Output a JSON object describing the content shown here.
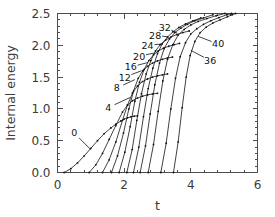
{
  "chart_data": {
    "type": "line",
    "title": "",
    "xlabel": "t",
    "ylabel": "Internal energy",
    "xlim": [
      0,
      6
    ],
    "ylim": [
      0.0,
      2.5
    ],
    "grid": false,
    "legend_position": "inline-labels",
    "x_ticks": [
      0,
      2,
      4,
      6
    ],
    "x_tick_labels": [
      "0",
      "2",
      "4",
      "6"
    ],
    "x_minor_per_major": 4,
    "y_ticks": [
      0.0,
      0.5,
      1.0,
      1.5,
      2.0,
      2.5
    ],
    "y_tick_labels": [
      "0.0",
      "0.5",
      "1.0",
      "1.5",
      "2.0",
      "2.5"
    ],
    "y_minor_per_major": 4,
    "marker": "dot",
    "series": [
      {
        "name": "0",
        "label": "0",
        "label_pos": [
          0.5,
          0.62
        ],
        "leader_to": [
          1.0,
          0.36
        ],
        "x": [
          0.2,
          0.4,
          0.6,
          0.8,
          1.0,
          1.2,
          1.4,
          1.6,
          1.75,
          1.9,
          2.0,
          2.1,
          2.2,
          2.3,
          2.4
        ],
        "y": [
          0.0,
          0.06,
          0.15,
          0.26,
          0.38,
          0.5,
          0.61,
          0.7,
          0.76,
          0.81,
          0.84,
          0.86,
          0.875,
          0.885,
          0.89
        ]
      },
      {
        "name": "4",
        "label": "4",
        "label_pos": [
          1.52,
          1.02
        ],
        "leader_to": [
          2.18,
          1.18
        ],
        "x": [
          0.95,
          1.15,
          1.35,
          1.55,
          1.75,
          1.95,
          2.1,
          2.25,
          2.4,
          2.55,
          2.7,
          2.85,
          3.0
        ],
        "y": [
          0.0,
          0.12,
          0.3,
          0.52,
          0.74,
          0.95,
          1.06,
          1.13,
          1.17,
          1.2,
          1.22,
          1.235,
          1.245
        ]
      },
      {
        "name": "8",
        "label": "8",
        "label_pos": [
          1.78,
          1.33
        ],
        "leader_to": [
          2.32,
          1.46
        ],
        "x": [
          1.35,
          1.55,
          1.75,
          1.95,
          2.1,
          2.25,
          2.4,
          2.55,
          2.7,
          2.85,
          3.0,
          3.15,
          3.3
        ],
        "y": [
          0.0,
          0.2,
          0.48,
          0.82,
          1.06,
          1.25,
          1.36,
          1.43,
          1.47,
          1.5,
          1.52,
          1.535,
          1.55
        ]
      },
      {
        "name": "12",
        "label": "12",
        "label_pos": [
          2.02,
          1.5
        ],
        "leader_to": [
          2.52,
          1.6
        ],
        "x": [
          1.62,
          1.8,
          1.98,
          2.14,
          2.28,
          2.42,
          2.56,
          2.7,
          2.85,
          3.0,
          3.15,
          3.3,
          3.45
        ],
        "y": [
          0.0,
          0.26,
          0.62,
          1.0,
          1.28,
          1.48,
          1.6,
          1.67,
          1.72,
          1.755,
          1.78,
          1.8,
          1.815
        ]
      },
      {
        "name": "16",
        "label": "16",
        "label_pos": [
          2.2,
          1.66
        ],
        "leader_to": [
          2.72,
          1.73
        ],
        "x": [
          1.85,
          2.02,
          2.18,
          2.32,
          2.46,
          2.6,
          2.74,
          2.88,
          3.02,
          3.18,
          3.34,
          3.5,
          3.66
        ],
        "y": [
          0.0,
          0.32,
          0.72,
          1.12,
          1.42,
          1.62,
          1.76,
          1.85,
          1.91,
          1.955,
          1.985,
          2.01,
          2.03
        ]
      },
      {
        "name": "20",
        "label": "20",
        "label_pos": [
          2.45,
          1.83
        ],
        "leader_to": [
          2.92,
          1.88
        ],
        "x": [
          2.08,
          2.24,
          2.38,
          2.52,
          2.66,
          2.8,
          2.94,
          3.08,
          3.24,
          3.4,
          3.58,
          3.76,
          3.95
        ],
        "y": [
          0.0,
          0.36,
          0.82,
          1.24,
          1.55,
          1.76,
          1.91,
          2.01,
          2.08,
          2.13,
          2.17,
          2.2,
          2.225
        ]
      },
      {
        "name": "24",
        "label": "24",
        "label_pos": [
          2.7,
          2.0
        ],
        "leader_to": [
          3.12,
          2.02
        ],
        "x": [
          2.28,
          2.44,
          2.58,
          2.72,
          2.86,
          3.0,
          3.14,
          3.3,
          3.46,
          3.64,
          3.84,
          4.06,
          4.3
        ],
        "y": [
          0.0,
          0.4,
          0.88,
          1.32,
          1.64,
          1.87,
          2.02,
          2.13,
          2.21,
          2.28,
          2.335,
          2.385,
          2.43
        ]
      },
      {
        "name": "28",
        "label": "28",
        "label_pos": [
          2.93,
          2.16
        ],
        "leader_to": [
          3.34,
          2.13
        ],
        "x": [
          2.48,
          2.64,
          2.78,
          2.92,
          3.06,
          3.2,
          3.36,
          3.52,
          3.7,
          3.9,
          4.12,
          4.38,
          4.66
        ],
        "y": [
          0.0,
          0.42,
          0.92,
          1.38,
          1.72,
          1.95,
          2.1,
          2.2,
          2.27,
          2.33,
          2.385,
          2.43,
          2.48
        ]
      },
      {
        "name": "32",
        "label": "32",
        "label_pos": [
          3.22,
          2.28
        ],
        "leader_to": [
          3.58,
          2.2
        ],
        "x": [
          2.72,
          2.88,
          3.02,
          3.16,
          3.3,
          3.46,
          3.62,
          3.8,
          4.0,
          4.22,
          4.48,
          4.76,
          5.02
        ],
        "y": [
          0.0,
          0.44,
          0.96,
          1.44,
          1.78,
          2.01,
          2.16,
          2.25,
          2.32,
          2.375,
          2.42,
          2.465,
          2.5
        ]
      },
      {
        "name": "36",
        "label": "36",
        "label_pos": [
          4.58,
          1.76
        ],
        "leader_to": [
          4.0,
          1.92
        ],
        "x": [
          3.1,
          3.26,
          3.4,
          3.54,
          3.68,
          3.84,
          4.0,
          4.18,
          4.38,
          4.6,
          4.84,
          5.08,
          5.22
        ],
        "y": [
          0.0,
          0.46,
          1.0,
          1.48,
          1.82,
          2.04,
          2.18,
          2.26,
          2.33,
          2.385,
          2.435,
          2.48,
          2.5
        ]
      },
      {
        "name": "40",
        "label": "40",
        "label_pos": [
          4.82,
          2.02
        ],
        "leader_to": [
          4.22,
          2.14
        ],
        "x": [
          3.48,
          3.62,
          3.74,
          3.86,
          3.98,
          4.12,
          4.28,
          4.46,
          4.66,
          4.88,
          5.1,
          5.24,
          5.34
        ],
        "y": [
          0.0,
          0.48,
          1.02,
          1.5,
          1.84,
          2.06,
          2.2,
          2.285,
          2.35,
          2.4,
          2.45,
          2.48,
          2.5
        ]
      }
    ]
  }
}
